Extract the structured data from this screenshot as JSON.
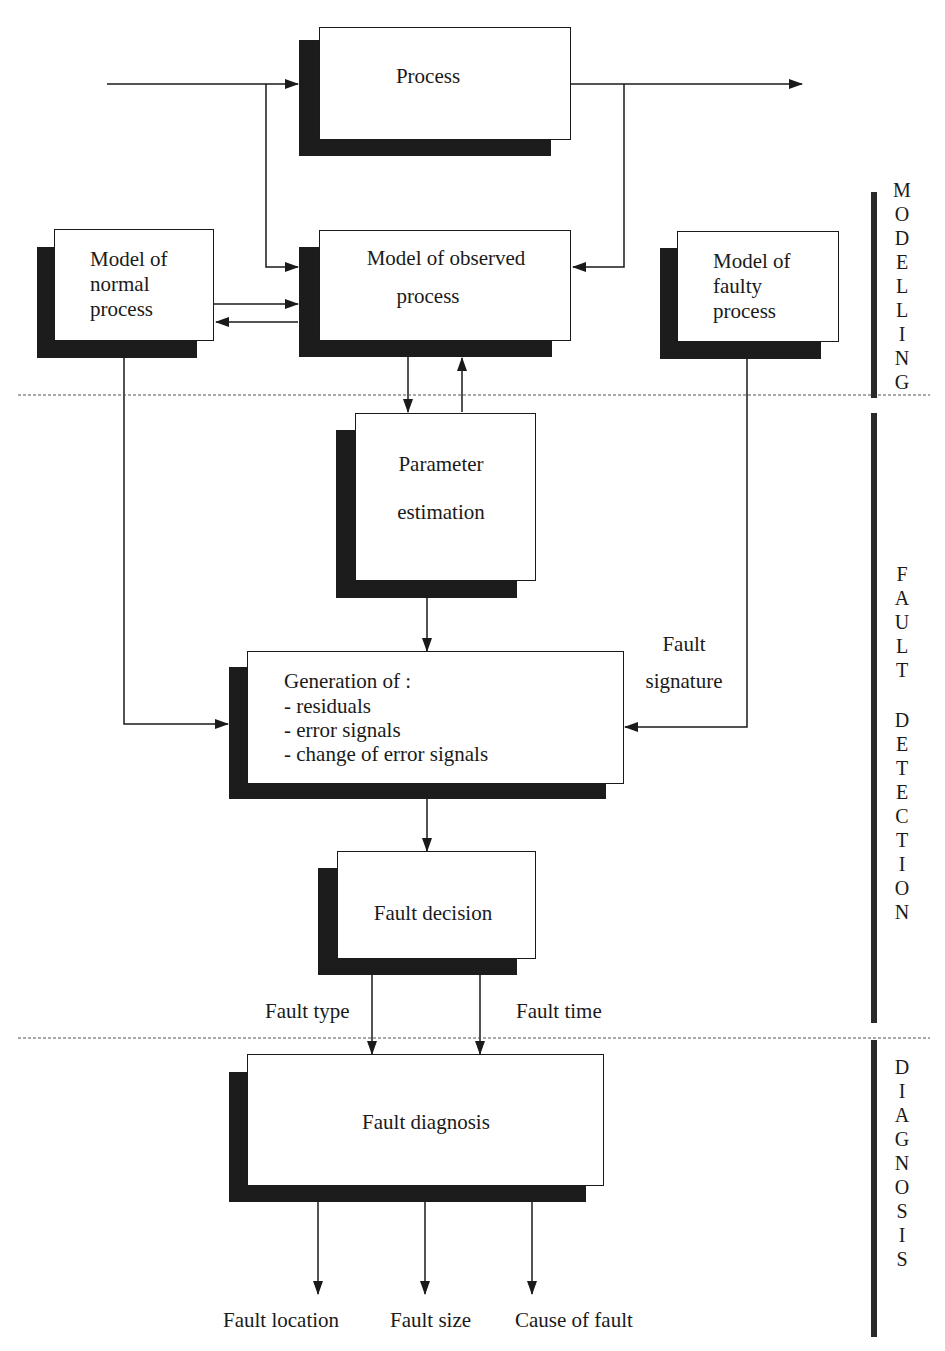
{
  "diagram": {
    "type": "block-flow-diagram",
    "phases": [
      {
        "id": "modelling",
        "label": "MODELLING"
      },
      {
        "id": "fault-detection",
        "label": "FAULT DETECTION"
      },
      {
        "id": "diagnosis",
        "label": "DIAGNOSIS"
      }
    ],
    "blocks": {
      "process": {
        "label": "Process"
      },
      "normal_model": {
        "lines": [
          "Model of",
          "normal",
          "process"
        ]
      },
      "observed_model": {
        "lines": [
          "Model of observed",
          "process"
        ]
      },
      "faulty_model": {
        "lines": [
          "Model of",
          "faulty",
          "process"
        ]
      },
      "param_est": {
        "lines": [
          "Parameter",
          "estimation"
        ]
      },
      "generation": {
        "lines": [
          "Generation of :",
          "- residuals",
          "- error signals",
          "- change of error signals"
        ]
      },
      "decision": {
        "label": "Fault decision"
      },
      "diagnosis": {
        "label": "Fault diagnosis"
      }
    },
    "edge_labels": {
      "fault_signature": [
        "Fault",
        "signature"
      ],
      "fault_type": "Fault type",
      "fault_time": "Fault time"
    },
    "outputs": [
      "Fault location",
      "Fault size",
      "Cause of fault"
    ],
    "side_labels": {
      "modelling": [
        "M",
        "O",
        "D",
        "E",
        "L",
        "L",
        "I",
        "N",
        "G"
      ],
      "fault": [
        "F",
        "A",
        "U",
        "L",
        "T"
      ],
      "detection": [
        "D",
        "E",
        "T",
        "E",
        "C",
        "T",
        "I",
        "O",
        "N"
      ],
      "diagnosis": [
        "D",
        "I",
        "A",
        "G",
        "N",
        "O",
        "S",
        "I",
        "S"
      ]
    },
    "edges": [
      {
        "from": "input",
        "to": "process"
      },
      {
        "from": "process",
        "to": "output"
      },
      {
        "from": "input",
        "to": "observed_model"
      },
      {
        "from": "process-output",
        "to": "observed_model"
      },
      {
        "from": "normal_model",
        "to": "observed_model"
      },
      {
        "from": "observed_model",
        "to": "normal_model"
      },
      {
        "from": "observed_model",
        "to": "param_est"
      },
      {
        "from": "param_est",
        "to": "observed_model"
      },
      {
        "from": "param_est",
        "to": "generation"
      },
      {
        "from": "normal_model",
        "to": "generation"
      },
      {
        "from": "faulty_model",
        "to": "generation",
        "label": "Fault signature"
      },
      {
        "from": "generation",
        "to": "decision"
      },
      {
        "from": "decision",
        "to": "diagnosis",
        "label": "Fault type"
      },
      {
        "from": "decision",
        "to": "diagnosis",
        "label": "Fault time"
      },
      {
        "from": "diagnosis",
        "to": "Fault location"
      },
      {
        "from": "diagnosis",
        "to": "Fault size"
      },
      {
        "from": "diagnosis",
        "to": "Cause of fault"
      }
    ]
  }
}
